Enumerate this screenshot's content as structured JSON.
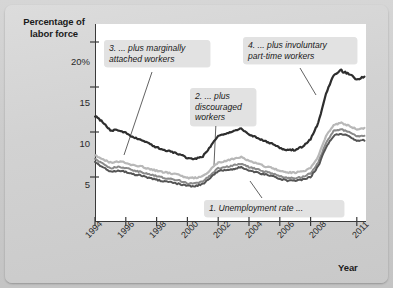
{
  "figure": {
    "background_color": "#cfcfcf",
    "panel_color": "#d6d6d6",
    "plot_background": "#ffffff"
  },
  "axis": {
    "y_title": "Percentage of\nlabor force",
    "x_title": "Year",
    "y_ticks": [
      "20%",
      "15",
      "10",
      "5"
    ],
    "y_tick_values": [
      20,
      15,
      10,
      5
    ],
    "x_ticks": [
      "1994",
      "1996",
      "1998",
      "2000",
      "2002",
      "2004",
      "2006",
      "2008",
      "2011"
    ],
    "x_tick_values": [
      1994,
      1996,
      1998,
      2000,
      2002,
      2004,
      2006,
      2008,
      2011
    ]
  },
  "callouts": [
    {
      "id": "c1",
      "label": "1. Unemployment rate ..."
    },
    {
      "id": "c2",
      "label": "2. ... plus\ndiscouraged\nworkers"
    },
    {
      "id": "c3",
      "label": "3. ... plus marginally\nattached workers"
    },
    {
      "id": "c4",
      "label": "4. ... plus involuntary\npart-time workers"
    }
  ],
  "chart_data": {
    "type": "line",
    "title": "",
    "xlabel": "Year",
    "ylabel": "Percentage of labor force",
    "xlim": [
      1994,
      2011.6
    ],
    "ylim": [
      0,
      22
    ],
    "yticks": [
      5,
      10,
      15,
      20
    ],
    "xticks": [
      1994,
      1996,
      1998,
      2000,
      2002,
      2004,
      2006,
      2008,
      2011
    ],
    "grid": false,
    "legend": "annotated-callouts",
    "series": [
      {
        "name": "1. Unemployment rate",
        "color": "#555555",
        "width": 2.0,
        "x": [
          1994.0,
          1994.5,
          1995.0,
          1995.5,
          1996.0,
          1996.5,
          1997.0,
          1997.5,
          1998.0,
          1998.5,
          1999.0,
          1999.5,
          2000.0,
          2000.5,
          2001.0,
          2001.5,
          2002.0,
          2002.5,
          2003.0,
          2003.5,
          2004.0,
          2004.5,
          2005.0,
          2005.5,
          2006.0,
          2006.5,
          2007.0,
          2007.5,
          2008.0,
          2008.5,
          2009.0,
          2009.5,
          2010.0,
          2010.5,
          2011.0,
          2011.5
        ],
        "values": [
          6.6,
          6.1,
          5.6,
          5.7,
          5.6,
          5.3,
          5.2,
          4.9,
          4.7,
          4.5,
          4.4,
          4.2,
          4.0,
          4.0,
          4.2,
          4.9,
          5.7,
          5.8,
          5.9,
          6.1,
          5.7,
          5.5,
          5.3,
          5.1,
          4.8,
          4.6,
          4.6,
          4.7,
          5.0,
          6.2,
          8.3,
          9.6,
          9.8,
          9.5,
          9.0,
          9.1
        ]
      },
      {
        "name": "2. ... plus discouraged workers",
        "color": "#8a8a8a",
        "width": 2.0,
        "x": [
          1994.0,
          1994.5,
          1995.0,
          1995.5,
          1996.0,
          1996.5,
          1997.0,
          1997.5,
          1998.0,
          1998.5,
          1999.0,
          1999.5,
          2000.0,
          2000.5,
          2001.0,
          2001.5,
          2002.0,
          2002.5,
          2003.0,
          2003.5,
          2004.0,
          2004.5,
          2005.0,
          2005.5,
          2006.0,
          2006.5,
          2007.0,
          2007.5,
          2008.0,
          2008.5,
          2009.0,
          2009.5,
          2010.0,
          2010.5,
          2011.0,
          2011.5
        ],
        "values": [
          7.0,
          6.5,
          6.0,
          6.1,
          6.0,
          5.7,
          5.6,
          5.3,
          5.1,
          4.9,
          4.8,
          4.6,
          4.3,
          4.3,
          4.5,
          5.2,
          6.0,
          6.1,
          6.3,
          6.5,
          6.1,
          5.9,
          5.6,
          5.4,
          5.1,
          4.9,
          4.9,
          5.0,
          5.4,
          6.6,
          8.8,
          10.1,
          10.3,
          10.0,
          9.5,
          9.6
        ]
      },
      {
        "name": "3. ... plus marginally attached workers",
        "color": "#b8b8b8",
        "width": 2.2,
        "x": [
          1994.0,
          1994.5,
          1995.0,
          1995.5,
          1996.0,
          1996.5,
          1997.0,
          1997.5,
          1998.0,
          1998.5,
          1999.0,
          1999.5,
          2000.0,
          2000.5,
          2001.0,
          2001.5,
          2002.0,
          2002.5,
          2003.0,
          2003.5,
          2004.0,
          2004.5,
          2005.0,
          2005.5,
          2006.0,
          2006.5,
          2007.0,
          2007.5,
          2008.0,
          2008.5,
          2009.0,
          2009.5,
          2010.0,
          2010.5,
          2011.0,
          2011.5
        ],
        "values": [
          7.4,
          7.0,
          6.6,
          6.7,
          6.6,
          6.3,
          6.2,
          5.9,
          5.7,
          5.5,
          5.4,
          5.2,
          4.9,
          4.9,
          5.1,
          5.8,
          6.6,
          6.8,
          7.0,
          7.2,
          6.8,
          6.5,
          6.2,
          6.0,
          5.7,
          5.5,
          5.5,
          5.6,
          6.0,
          7.3,
          9.5,
          10.8,
          11.0,
          10.7,
          10.3,
          10.4
        ]
      },
      {
        "name": "4. ... plus involuntary part-time workers",
        "color": "#2e2e2e",
        "width": 2.2,
        "x": [
          1994.0,
          1994.5,
          1995.0,
          1995.5,
          1996.0,
          1996.5,
          1997.0,
          1997.5,
          1998.0,
          1998.5,
          1999.0,
          1999.5,
          2000.0,
          2000.5,
          2001.0,
          2001.5,
          2002.0,
          2002.5,
          2003.0,
          2003.5,
          2004.0,
          2004.5,
          2005.0,
          2005.5,
          2006.0,
          2006.5,
          2007.0,
          2007.5,
          2008.0,
          2008.5,
          2009.0,
          2009.5,
          2010.0,
          2010.5,
          2011.0,
          2011.5
        ],
        "values": [
          11.8,
          11.1,
          10.2,
          10.2,
          9.9,
          9.4,
          9.1,
          8.7,
          8.3,
          8.0,
          7.8,
          7.5,
          7.1,
          7.0,
          7.3,
          8.4,
          9.6,
          9.8,
          10.1,
          10.4,
          9.7,
          9.4,
          9.0,
          8.7,
          8.2,
          8.0,
          8.0,
          8.4,
          9.2,
          11.0,
          14.2,
          16.4,
          16.8,
          16.5,
          15.9,
          16.2
        ]
      }
    ]
  }
}
